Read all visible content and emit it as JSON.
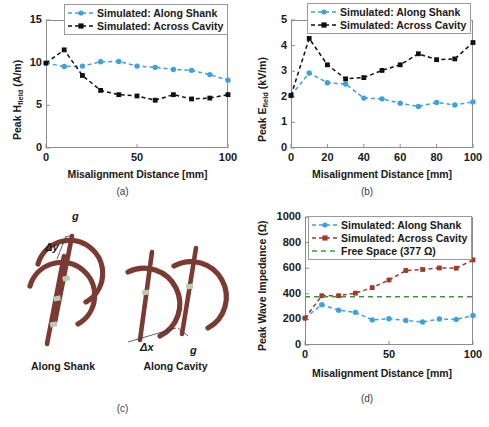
{
  "figure": {
    "panels": [
      "(a)",
      "(b)",
      "(c)",
      "(d)"
    ]
  },
  "panel_a": {
    "caption": "(a)",
    "ylabel_main": "Peak H",
    "ylabel_sub": "field",
    "ylabel_unit": " (A/m)",
    "xlabel": "Misalignment Distance [mm]",
    "yticks": [
      "0",
      "5",
      "10",
      "15"
    ],
    "xticks": [
      "0",
      "50",
      "100"
    ],
    "legend": [
      {
        "label": "Simulated: Along Shank",
        "color": "#3fa0dc",
        "marker": "circle",
        "dash": "4,3"
      },
      {
        "label": "Simulated: Across Cavity",
        "color": "#101010",
        "marker": "square",
        "dash": "4,3"
      }
    ]
  },
  "panel_b": {
    "caption": "(b)",
    "ylabel_main": "Peak E",
    "ylabel_sub": "field",
    "ylabel_unit": " (kV/m)",
    "xlabel": "Misalignment Distance [mm]",
    "yticks": [
      "0",
      "1",
      "2",
      "3",
      "4",
      "5"
    ],
    "xticks": [
      "0",
      "20",
      "40",
      "60",
      "80",
      "100"
    ],
    "legend": [
      {
        "label": "Simulated: Along Shank",
        "color": "#3fa0dc",
        "marker": "circle",
        "dash": "4,3"
      },
      {
        "label": "Simulated: Across Cavity",
        "color": "#101010",
        "marker": "square",
        "dash": "4,3"
      }
    ]
  },
  "panel_c": {
    "caption": "(c)",
    "left_label": "Along Shank",
    "right_label": "Along Cavity",
    "dim_left_gap": "g",
    "dim_left_offset": "Δy",
    "dim_right_gap": "g",
    "dim_right_offset": "Δx",
    "coil_color": "#7b3b32",
    "cap_color": "#b9cbb0"
  },
  "panel_d": {
    "caption": "(d)",
    "ylabel": "Peak Wave Impedance (Ω)",
    "xlabel": "Misalignment Distance [mm]",
    "yticks": [
      "0",
      "200",
      "400",
      "600",
      "800",
      "1000"
    ],
    "xticks": [
      "0",
      "50",
      "100"
    ],
    "legend": [
      {
        "label": "Simulated: Along Shank",
        "color": "#3fa0dc",
        "marker": "circle",
        "dash": "4,3"
      },
      {
        "label": "Simulated: Across Cavity",
        "color": "#9e3b29",
        "marker": "square",
        "dash": "4,3"
      },
      {
        "label": "Free Space (377 Ω)",
        "color": "#2f9e2f",
        "marker": "none",
        "dash": "5,4"
      }
    ]
  },
  "chart_data": [
    {
      "id": "panel_a",
      "type": "line",
      "title": "",
      "xlabel": "Misalignment Distance [mm]",
      "ylabel": "Peak H_field (A/m)",
      "xlim": [
        0,
        100
      ],
      "ylim": [
        0,
        15
      ],
      "xticks": [
        0,
        50,
        100
      ],
      "yticks": [
        0,
        5,
        10,
        15
      ],
      "grid": false,
      "legend_position": "top-center-outside",
      "x": [
        0,
        10,
        20,
        30,
        40,
        50,
        60,
        70,
        80,
        90,
        100
      ],
      "series": [
        {
          "name": "Simulated: Along Shank",
          "color": "#3fa0dc",
          "marker": "circle",
          "values": [
            9.95,
            9.55,
            9.6,
            10.1,
            10.15,
            9.6,
            9.45,
            9.2,
            9.1,
            8.6,
            7.95
          ]
        },
        {
          "name": "Simulated: Across Cavity",
          "color": "#101010",
          "marker": "square",
          "values": [
            9.95,
            11.5,
            8.5,
            6.75,
            6.25,
            6.1,
            5.6,
            6.25,
            5.75,
            5.85,
            6.25
          ]
        }
      ]
    },
    {
      "id": "panel_b",
      "type": "line",
      "title": "",
      "xlabel": "Misalignment Distance [mm]",
      "ylabel": "Peak E_field (kV/m)",
      "xlim": [
        0,
        100
      ],
      "ylim": [
        0,
        5
      ],
      "xticks": [
        0,
        20,
        40,
        60,
        80,
        100
      ],
      "yticks": [
        0,
        1,
        2,
        3,
        4,
        5
      ],
      "grid": false,
      "legend_position": "top-center-outside",
      "x": [
        0,
        10,
        20,
        30,
        40,
        50,
        60,
        70,
        80,
        90,
        100
      ],
      "series": [
        {
          "name": "Simulated: Along Shank",
          "color": "#3fa0dc",
          "marker": "circle",
          "values": [
            2.05,
            2.93,
            2.55,
            2.5,
            1.95,
            1.92,
            1.75,
            1.62,
            1.78,
            1.68,
            1.8
          ]
        },
        {
          "name": "Simulated: Across Cavity",
          "color": "#101010",
          "marker": "square",
          "values": [
            2.05,
            4.28,
            3.25,
            2.7,
            2.75,
            3.03,
            3.25,
            3.68,
            3.45,
            3.48,
            4.12
          ]
        }
      ]
    },
    {
      "id": "panel_d",
      "type": "line",
      "title": "",
      "xlabel": "Misalignment Distance [mm]",
      "ylabel": "Peak Wave Impedance (Ω)",
      "xlim": [
        0,
        100
      ],
      "ylim": [
        0,
        1000
      ],
      "xticks": [
        0,
        50,
        100
      ],
      "yticks": [
        0,
        200,
        400,
        600,
        800,
        1000
      ],
      "grid": false,
      "legend_position": "top-right-inside",
      "x": [
        0,
        10,
        20,
        30,
        40,
        50,
        60,
        70,
        80,
        90,
        100
      ],
      "series": [
        {
          "name": "Simulated: Along Shank",
          "color": "#3fa0dc",
          "marker": "circle",
          "values": [
            210,
            315,
            272,
            255,
            196,
            205,
            192,
            180,
            203,
            200,
            230
          ]
        },
        {
          "name": "Simulated: Across Cavity",
          "color": "#9e3b29",
          "marker": "square",
          "values": [
            210,
            385,
            385,
            405,
            448,
            508,
            582,
            590,
            602,
            600,
            665
          ]
        },
        {
          "name": "Free Space (377 Ω)",
          "color": "#2f9e2f",
          "marker": "none",
          "constant": 377,
          "values": [
            377,
            377,
            377,
            377,
            377,
            377,
            377,
            377,
            377,
            377,
            377
          ]
        }
      ]
    }
  ]
}
